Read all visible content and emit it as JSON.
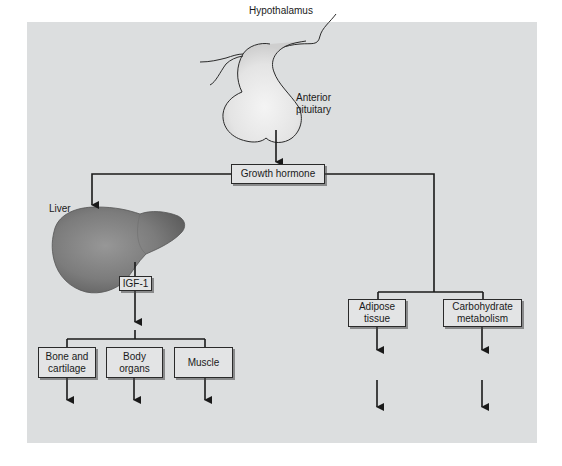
{
  "diagram": {
    "nodes": {
      "hypothalamus": "Hypothalamus",
      "anterior_pituitary_line1": "Anterior",
      "anterior_pituitary_line2": "pituitary",
      "growth_hormone": "Growth hormone",
      "liver": "Liver",
      "igf1": "IGF-1",
      "bone_line1": "Bone and",
      "bone_line2": "cartilage",
      "body_line1": "Body",
      "body_line2": "organs",
      "muscle": "Muscle",
      "adipose_line1": "Adipose",
      "adipose_line2": "tissue",
      "carb_line1": "Carbohydrate",
      "carb_line2": "metabolism"
    },
    "edges": [
      [
        "Anterior pituitary",
        "Growth hormone"
      ],
      [
        "Growth hormone",
        "Liver"
      ],
      [
        "Liver",
        "IGF-1"
      ],
      [
        "IGF-1",
        "Bone and cartilage"
      ],
      [
        "IGF-1",
        "Body organs"
      ],
      [
        "IGF-1",
        "Muscle"
      ],
      [
        "Growth hormone",
        "Adipose tissue"
      ],
      [
        "Growth hormone",
        "Carbohydrate metabolism"
      ]
    ],
    "colors": {
      "panel": "#dcdedf",
      "line": "#1a1a1a",
      "liver": "#7d7d7d"
    }
  }
}
